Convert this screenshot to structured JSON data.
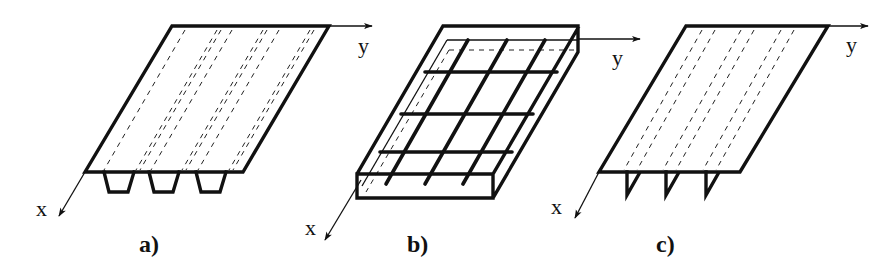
{
  "figure": {
    "stroke_color": "#111111",
    "background": "#ffffff"
  },
  "panels": [
    {
      "id": "a",
      "label": "a)",
      "axis_x_label": "x",
      "axis_y_label": "y",
      "rib_type": "trapezoidal",
      "rib_count": 3
    },
    {
      "id": "b",
      "label": "b)",
      "axis_x_label": "x",
      "axis_y_label": "y",
      "grid_bars_x": 3,
      "grid_bars_y": 3
    },
    {
      "id": "c",
      "label": "c)",
      "axis_x_label": "x",
      "axis_y_label": "y",
      "rib_type": "triangular",
      "rib_count": 3
    }
  ]
}
